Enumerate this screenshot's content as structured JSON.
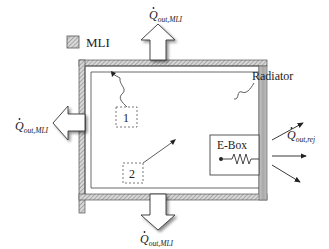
{
  "diagram": {
    "legend": {
      "label": "MLI"
    },
    "labels": {
      "q_top": {
        "main": "Q",
        "sub": "out,MLI"
      },
      "q_left": {
        "main": "Q",
        "sub": "out,MLI"
      },
      "q_bottom": {
        "main": "Q",
        "sub": "out,MLI"
      },
      "q_rej": {
        "main": "Q",
        "sub": "out,rej"
      },
      "radiator": "Radiator",
      "ebox": "E-Box",
      "callout_1": "1",
      "callout_2": "2"
    },
    "colors": {
      "hatch": "#9a9a9a",
      "radiator": "#b0b0b0",
      "line": "#333333"
    }
  }
}
